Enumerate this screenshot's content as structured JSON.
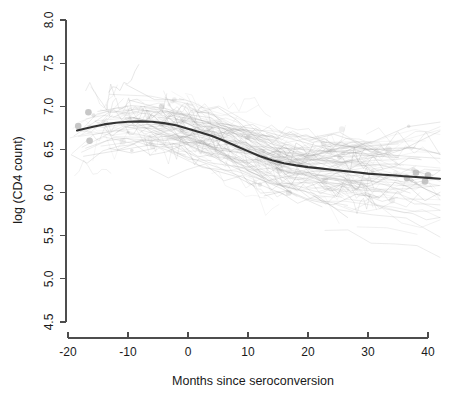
{
  "chart_data": {
    "type": "line",
    "title": "",
    "subtitle": "",
    "xlabel": "Months since seroconversion",
    "ylabel": "log (CD4 count)",
    "xlim": [
      -20,
      42
    ],
    "ylim": [
      4.5,
      8.0
    ],
    "xticks": [
      -20,
      -10,
      0,
      10,
      20,
      30,
      40
    ],
    "xtick_labels": [
      "-20",
      "-10",
      "0",
      "10",
      "20",
      "30",
      "40"
    ],
    "yticks": [
      4.5,
      5.0,
      5.5,
      6.0,
      6.5,
      7.0,
      7.5,
      8.0
    ],
    "ytick_labels": [
      "4.5",
      "5.0",
      "5.5",
      "6.0",
      "6.5",
      "7.0",
      "7.5",
      "8.0"
    ],
    "grid": false,
    "legend": "none",
    "series": [
      {
        "name": "Smooth fitted mean curve",
        "color": "#333333",
        "x": [
          -18.5,
          -16,
          -14,
          -12,
          -10,
          -8,
          -6,
          -4,
          -2,
          0,
          2,
          4,
          6,
          8,
          10,
          12,
          14,
          16,
          18,
          20,
          22,
          24,
          26,
          28,
          30,
          32,
          34,
          36,
          38,
          40,
          42
        ],
        "values": [
          6.72,
          6.76,
          6.79,
          6.81,
          6.82,
          6.825,
          6.82,
          6.805,
          6.78,
          6.74,
          6.7,
          6.655,
          6.6,
          6.54,
          6.48,
          6.42,
          6.375,
          6.34,
          6.315,
          6.295,
          6.28,
          6.265,
          6.25,
          6.235,
          6.22,
          6.21,
          6.2,
          6.19,
          6.18,
          6.17,
          6.16
        ]
      },
      {
        "name": "Individual subject trajectories",
        "color": "#9a9a9a",
        "style": "thin translucent lines",
        "count_approx": 250,
        "y_range_approx": [
          5.2,
          7.8
        ]
      }
    ],
    "highlighted_points": [
      {
        "x": -18.3,
        "y": 6.77
      },
      {
        "x": -16.6,
        "y": 6.93
      },
      {
        "x": -16.4,
        "y": 6.6
      },
      {
        "x": 36.5,
        "y": 6.17
      },
      {
        "x": 38.0,
        "y": 6.23
      },
      {
        "x": 40.0,
        "y": 6.2
      },
      {
        "x": 39.5,
        "y": 6.13
      }
    ]
  }
}
